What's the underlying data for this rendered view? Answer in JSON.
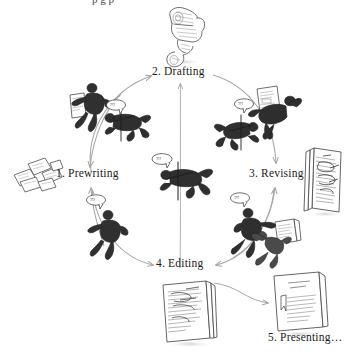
{
  "figure": {
    "title_partial": "p g p",
    "background_color": "#ffffff",
    "ink_color": "#333333",
    "arrow_color": "#9a9a9a",
    "label_color": "#1a1a1a"
  },
  "stages": [
    {
      "id": "prewriting",
      "label": "1. Prewriting",
      "position": "left"
    },
    {
      "id": "drafting",
      "label": "2. Drafting",
      "position": "top"
    },
    {
      "id": "revising",
      "label": "3. Revising",
      "position": "right"
    },
    {
      "id": "editing",
      "label": "4. Editing",
      "position": "bottom"
    },
    {
      "id": "presenting",
      "label": "5. Presenting…",
      "position": "bottom-right"
    }
  ],
  "speech_bubbles": [
    {
      "id": "bubble-center",
      "text": "?!!"
    },
    {
      "id": "bubble-upper-left",
      "text": "?!!"
    },
    {
      "id": "bubble-upper-right",
      "text": "?!!"
    },
    {
      "id": "bubble-lower-left",
      "text": "?!!"
    },
    {
      "id": "bubble-lower-right",
      "text": "?!!"
    }
  ],
  "icons": {
    "scroll": "rolled-scroll-icon",
    "note_cards": "scattered-note-cards-icon",
    "marked_up_pages": "marked-up-draft-pages-icon",
    "edited_pages": "edited-draft-pages-icon",
    "final_report": "bound-final-report-icon"
  },
  "figures": [
    {
      "id": "figure-center",
      "pose": "falling-with-pen"
    },
    {
      "id": "figure-prewriting-up",
      "pose": "running-holding-paper"
    },
    {
      "id": "figure-drafting-left",
      "pose": "falling-with-pen"
    },
    {
      "id": "figure-drafting-right",
      "pose": "falling-with-pen"
    },
    {
      "id": "figure-revising-right",
      "pose": "tumbling-with-paper"
    },
    {
      "id": "figure-editing-left",
      "pose": "walking-pointing"
    },
    {
      "id": "figure-editing-right",
      "pose": "striding-pointing"
    },
    {
      "id": "figure-presenting",
      "pose": "tumbling-holding-pages"
    }
  ]
}
